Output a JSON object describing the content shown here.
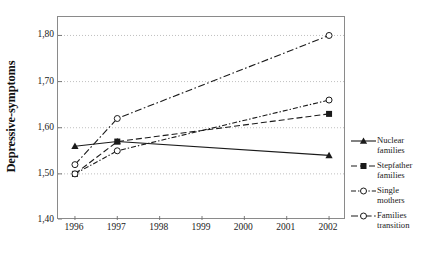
{
  "chart_data": {
    "type": "line",
    "title": "",
    "xlabel": "",
    "ylabel": "Depressive-symptoms",
    "x": [
      1996,
      1997,
      2002
    ],
    "categories": [
      "1996",
      "1997",
      "1998",
      "1999",
      "2000",
      "2001",
      "2002"
    ],
    "xtick_labels": [
      "1996",
      "1997",
      "1998",
      "1999",
      "2000",
      "2001",
      "2002"
    ],
    "ytick_labels": [
      "1,40",
      "1,50",
      "1,60",
      "1,70",
      "1,80"
    ],
    "ytick_values": [
      1.4,
      1.5,
      1.6,
      1.7,
      1.8
    ],
    "ylim": [
      1.4,
      1.84
    ],
    "xlim": [
      1995.6,
      2002.4
    ],
    "grid": "horizontal-dotted",
    "legend_position": "right",
    "series": [
      {
        "name": "Nuclear families",
        "label": "Nuclear\nfamilies",
        "marker": "filled-triangle",
        "line_style": "solid",
        "color": "#1a1a1a",
        "x": [
          1996,
          1997,
          2002
        ],
        "values": [
          1.56,
          1.57,
          1.54
        ]
      },
      {
        "name": "Stepfather families",
        "label": "Stepfather\nfamilies",
        "marker": "filled-square",
        "line_style": "dashed",
        "color": "#1a1a1a",
        "x": [
          1996,
          1997,
          2002
        ],
        "values": [
          1.5,
          1.57,
          1.63
        ]
      },
      {
        "name": "Single mothers",
        "label": "Single\nmothers",
        "marker": "open-circle",
        "line_style": "dotted-dash",
        "color": "#1a1a1a",
        "x": [
          1996,
          1997,
          2002
        ],
        "values": [
          1.5,
          1.55,
          1.66
        ]
      },
      {
        "name": "Families transition",
        "label": "Families\ntransition",
        "marker": "open-circle",
        "line_style": "dash-dot",
        "color": "#1a1a1a",
        "x": [
          1996,
          1997,
          2002
        ],
        "values": [
          1.52,
          1.62,
          1.8
        ]
      }
    ]
  },
  "axes": {
    "y_title": "Depressive-symptoms"
  },
  "colors": {
    "ink": "#1a1a1a",
    "frame": "#8a8a8a",
    "grid": "#b0b0b0",
    "background": "#ffffff"
  }
}
